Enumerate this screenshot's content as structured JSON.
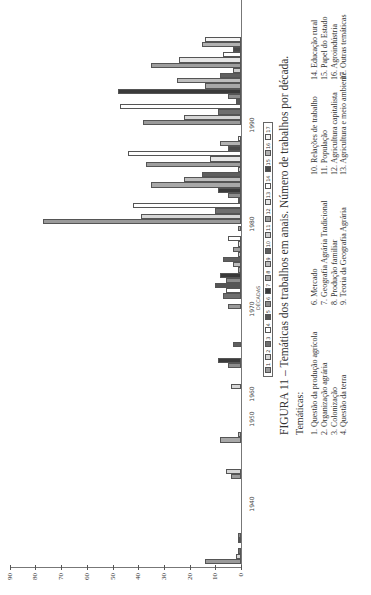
{
  "chart_data": {
    "type": "bar",
    "orientation": "vertical bars, image rotated 90° counter-clockwise",
    "title": "FIGURA 11 – Temáticas dos trabalhos em anais. Número de trabalhos por década.",
    "xlabel": "DÉCADAS",
    "ylabel": "",
    "ylim": [
      0,
      90
    ],
    "yticks": [
      0,
      10,
      20,
      30,
      40,
      50,
      60,
      70,
      80,
      90
    ],
    "categories": [
      "1940",
      "1950",
      "1960",
      "1970",
      "1980",
      "1990"
    ],
    "legend_position": "bottom (below x-axis)",
    "series": [
      {
        "name": "1",
        "values": [
          14,
          4,
          0,
          5,
          77,
          38
        ]
      },
      {
        "name": "2",
        "values": [
          2,
          6,
          4,
          0,
          39,
          22
        ]
      },
      {
        "name": "3",
        "values": [
          1,
          0,
          0,
          7,
          10,
          9
        ]
      },
      {
        "name": "4",
        "values": [
          0,
          0,
          0,
          6,
          42,
          47
        ]
      },
      {
        "name": "5",
        "values": [
          1,
          0,
          0,
          10,
          1,
          2
        ]
      },
      {
        "name": "6",
        "values": [
          1,
          0,
          5,
          6,
          5,
          5
        ]
      },
      {
        "name": "7",
        "values": [
          0,
          0,
          9,
          8,
          9,
          48
        ]
      },
      {
        "name": "8",
        "values": [
          0,
          8,
          0,
          1,
          35,
          14
        ]
      },
      {
        "name": "9",
        "values": [
          0,
          1,
          0,
          3,
          22,
          25
        ]
      },
      {
        "name": "10",
        "values": [
          0,
          0,
          3,
          7,
          15,
          8
        ]
      },
      {
        "name": "11",
        "values": [
          0,
          0,
          0,
          1,
          1,
          3
        ]
      },
      {
        "name": "12",
        "values": [
          0,
          0,
          0,
          3,
          37,
          35
        ]
      },
      {
        "name": "13",
        "values": [
          0,
          0,
          0,
          1,
          12,
          24
        ]
      },
      {
        "name": "14",
        "values": [
          0,
          0,
          0,
          5,
          44,
          7
        ]
      },
      {
        "name": "15",
        "values": [
          0,
          0,
          0,
          0,
          5,
          3
        ]
      },
      {
        "name": "16",
        "values": [
          0,
          0,
          0,
          1,
          8,
          15
        ]
      },
      {
        "name": "17",
        "values": [
          0,
          0,
          0,
          0,
          1,
          14
        ]
      }
    ],
    "grid": false
  },
  "caption": {
    "figure": "FIGURA 11 – Temáticas dos trabalhos em anais. Número de trabalhos por década.",
    "subtitle": "Temáticas:"
  },
  "axis": {
    "x_title": "DÉCADAS",
    "yticks": [
      "0",
      "10",
      "20",
      "30",
      "40",
      "50",
      "60",
      "70",
      "80",
      "90"
    ],
    "decades": [
      "1940",
      "1950",
      "1960",
      "1970",
      "1980",
      "1990"
    ]
  },
  "legend": {
    "items": [
      "1",
      "2",
      "3",
      "4",
      "5",
      "6",
      "7",
      "8",
      "9",
      "10",
      "11",
      "12",
      "13",
      "14",
      "15",
      "16",
      "17"
    ],
    "colors": [
      "#9a9a9a",
      "#d6d6d6",
      "#6f6f6f",
      "#ffffff",
      "#555555",
      "#8c8c8c",
      "#3a3a3a",
      "#a8a8a8",
      "#bdbdbd",
      "#5f5f5f",
      "#cfcfcf",
      "#9e9e9e",
      "#e6e6e6",
      "#ffffff",
      "#4a4a4a",
      "#b2b2b2",
      "#f4f4f4"
    ]
  },
  "themes": {
    "col1": [
      "1. Questão da produção agrícola",
      "2. Organização agrária",
      "3. Colonização",
      "4. Questão da terra"
    ],
    "col2": [
      "6. Mercado",
      "7. Geografia Agrária Tradicional",
      "8. Produção familiar",
      "9. Teoria da Geografia Agrária"
    ],
    "col3": [
      "10. Relações de trabalho",
      "11. População",
      "12. Agricultura capitalista",
      "13. Agricultura e meio ambiente"
    ],
    "col4": [
      "14.  Educação rural",
      "15. Papel do Estado",
      "16. Agroindústria",
      "17. Outras temáticas"
    ]
  }
}
